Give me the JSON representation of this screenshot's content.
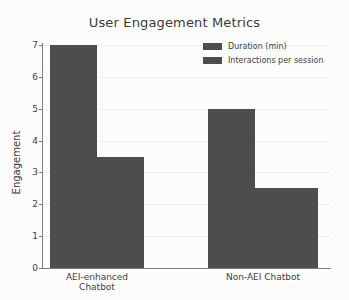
{
  "chart_data": {
    "type": "bar",
    "title": "User Engagement Metrics",
    "xlabel": "",
    "ylabel": "Engagement",
    "categories": [
      "AEI-enhanced Chatbot",
      "Non-AEI Chatbot"
    ],
    "series": [
      {
        "name": "Duration (min)",
        "values": [
          7.0,
          5.0
        ],
        "color": "#4d4d4d"
      },
      {
        "name": "Interactions per session",
        "values": [
          3.5,
          2.5
        ],
        "color": "#4d4d4d"
      }
    ],
    "ylim": [
      0,
      7
    ],
    "ytick_labels": [
      "0",
      "1",
      "2",
      "3",
      "4",
      "5",
      "6",
      "7"
    ],
    "grid": true,
    "legend_position": "top-right",
    "background_color": "#fcfcfc",
    "axis_color": "#7d7d7d"
  },
  "axis": {
    "y_label": "Engagement",
    "ticks": [
      {
        "value": 7,
        "label": "7"
      },
      {
        "value": 6,
        "label": "6"
      },
      {
        "value": 5,
        "label": "5"
      },
      {
        "value": 4,
        "label": "4"
      },
      {
        "value": 3,
        "label": "3"
      },
      {
        "value": 2,
        "label": "2"
      },
      {
        "value": 1,
        "label": "1"
      },
      {
        "value": 0,
        "label": "0"
      }
    ]
  },
  "bars": [
    {
      "group": "AEI-enhanced Chatbot",
      "series": "Duration (min)",
      "value": 7.0
    },
    {
      "group": "AEI-enhanced Chatbot",
      "series": "Interactions per session",
      "value": 3.5
    },
    {
      "group": "Non-AEI Chatbot",
      "series": "Duration (min)",
      "value": 5.0
    },
    {
      "group": "Non-AEI Chatbot",
      "series": "Interactions per session",
      "value": 2.5
    }
  ],
  "legend": {
    "items": [
      {
        "label": "Duration (min)"
      },
      {
        "label": "Interactions per session"
      }
    ]
  }
}
